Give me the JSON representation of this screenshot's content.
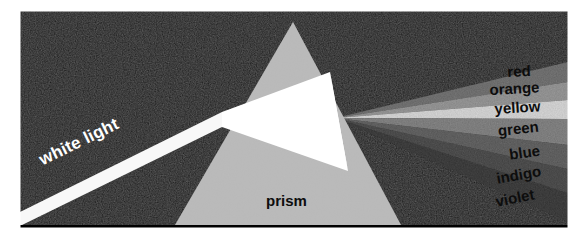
{
  "figure": {
    "kind": "optics-diagram",
    "canvas": {
      "width": 588,
      "height": 240
    },
    "plate": {
      "x": 20,
      "y": 11,
      "width": 548,
      "height": 217
    },
    "background_color": "#0e0e0e",
    "page_color": "#ffffff"
  },
  "labels": {
    "white_light": "white light",
    "prism": "prism",
    "red": "red",
    "orange": "orange",
    "yellow": "yellow",
    "green": "green",
    "blue": "blue",
    "indigo": "indigo",
    "violet": "violet"
  },
  "colors": {
    "background": "#0e0e0e",
    "prism_body": "#b4b4b4",
    "incident_beam": "#f8f8f8",
    "internal_beam": "#ffffff",
    "red_band": "#6e6e6e",
    "orange_band": "#9a9a9a",
    "yellow_band": "#e8e8e8",
    "green_band": "#828282",
    "blue_band": "#5a5a5a",
    "indigo_band": "#414141",
    "violet_band": "#2e2e2e",
    "label_dark": "#0d0d0d",
    "label_light": "#ffffff"
  },
  "spectrum": {
    "order": [
      "red",
      "orange",
      "yellow",
      "green",
      "blue",
      "indigo",
      "violet"
    ],
    "fan_origin": {
      "x": 336,
      "y": 118
    },
    "bands": [
      {
        "name": "red",
        "fill": "#6e6e6e",
        "right_top": 62,
        "right_bottom": 82,
        "label_x": 508,
        "label_y": 64,
        "rotate": -2.5
      },
      {
        "name": "orange",
        "fill": "#9a9a9a",
        "right_top": 82,
        "right_bottom": 100,
        "label_x": 500,
        "label_y": 82,
        "rotate": -3.0
      },
      {
        "name": "yellow",
        "fill": "#e8e8e8",
        "right_top": 100,
        "right_bottom": 119,
        "label_x": 503,
        "label_y": 101,
        "rotate": -3.5
      },
      {
        "name": "green",
        "fill": "#828282",
        "right_top": 119,
        "right_bottom": 145,
        "label_x": 505,
        "label_y": 124,
        "rotate": -6.0
      },
      {
        "name": "blue",
        "fill": "#5a5a5a",
        "right_top": 145,
        "right_bottom": 169,
        "label_x": 514,
        "label_y": 148,
        "rotate": -8.0
      },
      {
        "name": "indigo",
        "fill": "#414141",
        "right_top": 169,
        "right_bottom": 193,
        "label_x": 501,
        "label_y": 171,
        "rotate": -10.0
      },
      {
        "name": "violet",
        "fill": "#2e2e2e",
        "right_top": 193,
        "right_bottom": 222,
        "label_x": 499,
        "label_y": 193,
        "rotate": -11.0
      }
    ]
  },
  "prism": {
    "apex": {
      "x": 293,
      "y": 22
    },
    "base_left": {
      "x": 175,
      "y": 225
    },
    "base_right": {
      "x": 401,
      "y": 225
    },
    "fill": "#b4b4b4",
    "label_position": {
      "x": 268,
      "y": 198
    }
  },
  "beam": {
    "entry_point": {
      "x": 222,
      "y": 118
    },
    "start_point": {
      "x": 20,
      "y": 222
    },
    "angle_degrees": -26,
    "label_position": {
      "x": 36,
      "y": 160
    },
    "label_rotate": -26
  }
}
